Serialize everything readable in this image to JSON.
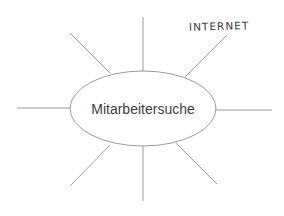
{
  "diagram": {
    "type": "mindmap",
    "center": {
      "label": "Mitarbeitersuche",
      "shape": "ellipse"
    },
    "branches": [
      {
        "direction": "north",
        "label": ""
      },
      {
        "direction": "north-east",
        "label": "INTERNET"
      },
      {
        "direction": "east",
        "label": ""
      },
      {
        "direction": "south-east",
        "label": ""
      },
      {
        "direction": "south",
        "label": ""
      },
      {
        "direction": "south-west",
        "label": ""
      },
      {
        "direction": "west",
        "label": ""
      },
      {
        "direction": "north-west",
        "label": ""
      }
    ],
    "branch_count": 8,
    "colors": {
      "line": "#9b9b9b",
      "center_text": "#3d3d3d",
      "branch_text": "#3a3a3a",
      "background": "#ffffff"
    }
  }
}
